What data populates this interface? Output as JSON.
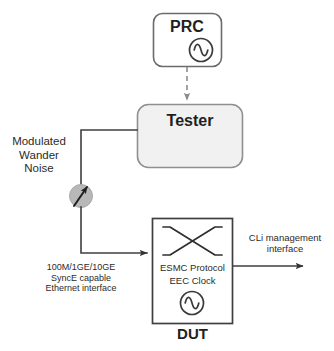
{
  "diagram": {
    "colors": {
      "stroke": "#4d4d4d",
      "dark_stroke": "#333333",
      "tester_fill": "#f1f1f1",
      "prc_fill": "#ffffff",
      "dut_fill": "#ffffff",
      "circle_fill": "#b8b8b8",
      "circle_stroke": "#9a9a9a",
      "text": "#2b2b2b",
      "dashed": "#8c8c8c"
    },
    "nodes": {
      "prc": {
        "label": "PRC",
        "icon": "sine-wave-circle-icon",
        "shape": "rounded-rect"
      },
      "tester": {
        "label": "Tester",
        "shape": "rounded-rect"
      },
      "dut": {
        "caption": "DUT",
        "inner_line_1": "ESMC Protocol",
        "inner_line_2": "EEC Clock",
        "cross_icon": "crossconnect-x-icon",
        "clock_icon": "sine-wave-circle-icon",
        "shape": "rect"
      },
      "noise_injector": {
        "icon": "noise-injection-node-icon",
        "shape": "circle-with-arrow"
      }
    },
    "labels": {
      "wander_noise": "Modulated\nWander\nNoise",
      "ethernet_interface": "100M/1GE/10GE\nSyncE capable\nEthernet interface",
      "cli_interface": "CLi management\ninterface"
    },
    "connections": [
      {
        "name": "prc-to-tester",
        "style": "dashed",
        "arrow": "down",
        "from": "prc",
        "to": "tester"
      },
      {
        "name": "tester-to-injector",
        "style": "solid",
        "arrow": "none",
        "from": "tester",
        "to": "noise_injector"
      },
      {
        "name": "injector-to-dut",
        "style": "solid",
        "arrow": "right",
        "from": "noise_injector",
        "to": "dut"
      },
      {
        "name": "dut-to-cli",
        "style": "solid",
        "arrow": "right",
        "from": "dut",
        "to": "cli"
      }
    ]
  }
}
